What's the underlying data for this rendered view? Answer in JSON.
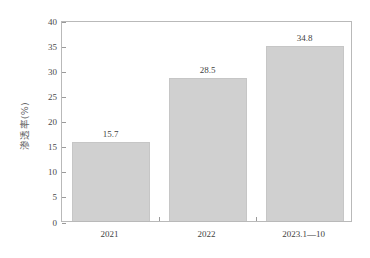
{
  "chart_data": {
    "type": "bar",
    "title": "",
    "xlabel": "",
    "ylabel": "渗透率(%)",
    "categories": [
      "2021",
      "2022",
      "2023.1—10"
    ],
    "values": [
      15.7,
      28.5,
      34.8
    ],
    "value_labels": [
      "15.7",
      "28.5",
      "34.8"
    ],
    "ylim": [
      0,
      40
    ],
    "yticks": [
      0,
      5,
      10,
      15,
      20,
      25,
      30,
      35,
      40
    ],
    "ytick_labels": [
      "0",
      "5",
      "10",
      "15",
      "20",
      "25",
      "30",
      "35",
      "40"
    ],
    "grid": false,
    "legend": null,
    "series": [
      {
        "name": "渗透率(%)",
        "values": [
          15.7,
          28.5,
          34.8
        ]
      }
    ],
    "colors": {
      "bar_fill": "#d0d0d0",
      "bar_border": "#c6c6c6",
      "axis": "#b9b9b9",
      "tick": "#9a9a9a",
      "text": "#3f3f3f",
      "background": "#ffffff"
    }
  }
}
